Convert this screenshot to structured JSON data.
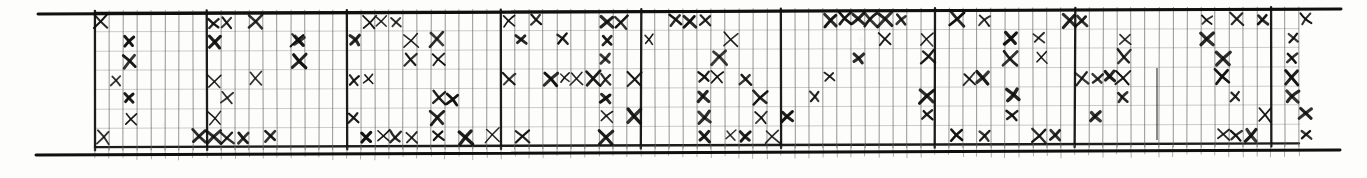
{
  "figure": {
    "kind": "hand-drawn-grid-tally",
    "title": "",
    "ink_color": "#101010",
    "grid_color": "#5b5b5b",
    "faint_grid_color": "#9a9a9a",
    "paper_color": "#fdfdfc"
  },
  "chart_data": {
    "type": "heatmap",
    "title": "",
    "subtitle": "",
    "xlabel": "",
    "ylabel": "",
    "legend": [],
    "annotations": [],
    "grid": true,
    "rows": 7,
    "columns": 86,
    "cell_width": 14,
    "cell_height": 19.2,
    "origin_x": 95,
    "origin_y": 13,
    "row_labels": [
      "1",
      "2",
      "3",
      "4",
      "5",
      "6",
      "7"
    ],
    "column_labels": [],
    "section_dividers_x": [
      95,
      205,
      350,
      497,
      640,
      785,
      930,
      1073,
      1274,
      1292
    ],
    "border": {
      "top_left": [
        38,
        13
      ],
      "top_right": [
        1341,
        9
      ],
      "bottom_left": [
        36,
        155
      ],
      "bottom_right": [
        1340,
        150
      ],
      "thickness": 3
    },
    "marks": [
      {
        "c": 0,
        "r": 0
      },
      {
        "c": 8,
        "r": 0
      },
      {
        "c": 29,
        "r": 0
      },
      {
        "c": 31,
        "r": 0
      },
      {
        "c": 43,
        "r": 0
      },
      {
        "c": 2,
        "r": 1
      },
      {
        "c": 14,
        "r": 1
      },
      {
        "c": 22,
        "r": 1
      },
      {
        "c": 30,
        "r": 1
      },
      {
        "c": 2,
        "r": 2
      },
      {
        "c": 22,
        "r": 2
      },
      {
        "c": 8,
        "r": 3
      },
      {
        "c": 1,
        "r": 3
      },
      {
        "c": 29,
        "r": 3
      },
      {
        "c": 2,
        "r": 4
      },
      {
        "c": 25,
        "r": 4
      },
      {
        "c": 2,
        "r": 5
      },
      {
        "c": 38,
        "r": 5
      },
      {
        "c": 0,
        "r": 6
      },
      {
        "c": 8,
        "r": 6
      },
      {
        "c": 22,
        "r": 6
      },
      {
        "c": 24,
        "r": 6
      },
      {
        "c": 26,
        "r": 6
      },
      {
        "c": 28,
        "r": 6
      },
      {
        "c": 30,
        "r": 6
      },
      {
        "c": 43,
        "r": 6
      },
      {
        "c": 9,
        "r": 0
      },
      {
        "c": 11,
        "r": 0
      },
      {
        "c": 8,
        "r": 1
      },
      {
        "c": 14,
        "r": 1
      },
      {
        "c": 18,
        "r": 1
      },
      {
        "c": 14,
        "r": 2
      },
      {
        "c": 11,
        "r": 3
      },
      {
        "c": 9,
        "r": 4
      },
      {
        "c": 8,
        "r": 5
      },
      {
        "c": 18,
        "r": 5
      },
      {
        "c": 7,
        "r": 6
      },
      {
        "c": 9,
        "r": 6
      },
      {
        "c": 10,
        "r": 6
      },
      {
        "c": 12,
        "r": 6
      },
      {
        "c": 19,
        "r": 0
      },
      {
        "c": 20,
        "r": 0
      },
      {
        "c": 21,
        "r": 0
      },
      {
        "c": 24,
        "r": 1
      },
      {
        "c": 24,
        "r": 2
      },
      {
        "c": 18,
        "r": 3
      },
      {
        "c": 19,
        "r": 3
      },
      {
        "c": 24,
        "r": 4
      },
      {
        "c": 24,
        "r": 5
      },
      {
        "c": 19,
        "r": 6
      },
      {
        "c": 20,
        "r": 6
      },
      {
        "c": 21,
        "r": 6
      },
      {
        "c": 36,
        "r": 0
      },
      {
        "c": 37,
        "r": 0
      },
      {
        "c": 33,
        "r": 1
      },
      {
        "c": 36,
        "r": 1
      },
      {
        "c": 36,
        "r": 2
      },
      {
        "c": 32,
        "r": 3
      },
      {
        "c": 33,
        "r": 3
      },
      {
        "c": 34,
        "r": 3
      },
      {
        "c": 35,
        "r": 3
      },
      {
        "c": 36,
        "r": 3
      },
      {
        "c": 38,
        "r": 3
      },
      {
        "c": 36,
        "r": 4
      },
      {
        "c": 36,
        "r": 5
      },
      {
        "c": 36,
        "r": 6
      },
      {
        "c": 41,
        "r": 0
      },
      {
        "c": 42,
        "r": 0
      },
      {
        "c": 39,
        "r": 1
      },
      {
        "c": 45,
        "r": 1
      },
      {
        "c": 44,
        "r": 2
      },
      {
        "c": 43,
        "r": 3
      },
      {
        "c": 44,
        "r": 3
      },
      {
        "c": 46,
        "r": 3
      },
      {
        "c": 43,
        "r": 4
      },
      {
        "c": 47,
        "r": 4
      },
      {
        "c": 43,
        "r": 5
      },
      {
        "c": 47,
        "r": 5
      },
      {
        "c": 45,
        "r": 6
      },
      {
        "c": 46,
        "r": 6
      },
      {
        "c": 52,
        "r": 0
      },
      {
        "c": 53,
        "r": 0
      },
      {
        "c": 54,
        "r": 0
      },
      {
        "c": 55,
        "r": 0
      },
      {
        "c": 56,
        "r": 0
      },
      {
        "c": 57,
        "r": 0
      },
      {
        "c": 56,
        "r": 1
      },
      {
        "c": 54,
        "r": 2
      },
      {
        "c": 52,
        "r": 3
      },
      {
        "c": 51,
        "r": 4
      },
      {
        "c": 49,
        "r": 5
      },
      {
        "c": 48,
        "r": 6
      },
      {
        "c": 61,
        "r": 0
      },
      {
        "c": 63,
        "r": 0
      },
      {
        "c": 59,
        "r": 1
      },
      {
        "c": 65,
        "r": 1
      },
      {
        "c": 59,
        "r": 2
      },
      {
        "c": 65,
        "r": 2
      },
      {
        "c": 62,
        "r": 3
      },
      {
        "c": 63,
        "r": 3
      },
      {
        "c": 59,
        "r": 4
      },
      {
        "c": 65,
        "r": 4
      },
      {
        "c": 59,
        "r": 5
      },
      {
        "c": 65,
        "r": 5
      },
      {
        "c": 61,
        "r": 6
      },
      {
        "c": 63,
        "r": 6
      },
      {
        "c": 69,
        "r": 0
      },
      {
        "c": 70,
        "r": 0
      },
      {
        "c": 79,
        "r": 0
      },
      {
        "c": 81,
        "r": 0
      },
      {
        "c": 83,
        "r": 0
      },
      {
        "c": 86,
        "r": 0
      },
      {
        "c": 67,
        "r": 1
      },
      {
        "c": 73,
        "r": 1
      },
      {
        "c": 79,
        "r": 1
      },
      {
        "c": 85,
        "r": 1
      },
      {
        "c": 67,
        "r": 2
      },
      {
        "c": 73,
        "r": 2
      },
      {
        "c": 80,
        "r": 2
      },
      {
        "c": 85,
        "r": 2
      },
      {
        "c": 70,
        "r": 3
      },
      {
        "c": 71,
        "r": 3
      },
      {
        "c": 72,
        "r": 3
      },
      {
        "c": 73,
        "r": 3
      },
      {
        "c": 80,
        "r": 3
      },
      {
        "c": 85,
        "r": 3
      },
      {
        "c": 73,
        "r": 4
      },
      {
        "c": 81,
        "r": 4
      },
      {
        "c": 85,
        "r": 4
      },
      {
        "c": 71,
        "r": 5
      },
      {
        "c": 83,
        "r": 5
      },
      {
        "c": 86,
        "r": 5
      },
      {
        "c": 67,
        "r": 6
      },
      {
        "c": 68,
        "r": 6
      },
      {
        "c": 80,
        "r": 6
      },
      {
        "c": 81,
        "r": 6
      },
      {
        "c": 82,
        "r": 6
      },
      {
        "c": 86,
        "r": 6
      }
    ],
    "extra_strokes": [
      {
        "x1": 1157,
        "y1": 68,
        "x2": 1157,
        "y2": 140,
        "note": "vertical pencil stroke"
      }
    ]
  }
}
